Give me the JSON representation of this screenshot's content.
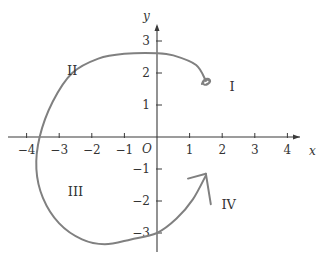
{
  "chart_data": {
    "type": "line",
    "title": "",
    "xlabel": "x",
    "ylabel": "y",
    "origin_label": "O",
    "xlim": [
      -4.5,
      4.6
    ],
    "ylim": [
      -3.6,
      3.6
    ],
    "grid": false,
    "x_ticks": [
      -4,
      -3,
      -2,
      -1,
      1,
      2,
      3,
      4
    ],
    "x_tick_labels": [
      "−4",
      "−3",
      "−2",
      "−1",
      "1",
      "2",
      "3",
      "4"
    ],
    "y_ticks": [
      3,
      2,
      1,
      -1,
      -2,
      -3
    ],
    "y_tick_labels": [
      "3",
      "2",
      "1",
      "−1",
      "−2",
      "−3"
    ],
    "quadrant_labels": [
      {
        "text": "I",
        "x": 2.3,
        "y": 1.6
      },
      {
        "text": "II",
        "x": -2.6,
        "y": 2.1
      },
      {
        "text": "III",
        "x": -2.5,
        "y": -1.7
      },
      {
        "text": "IV",
        "x": 2.2,
        "y": -2.1
      }
    ],
    "series": [
      {
        "name": "path",
        "color": "#808080",
        "points": [
          [
            1.5,
            1.75
          ],
          [
            1.2,
            2.25
          ],
          [
            0.5,
            2.55
          ],
          [
            0.0,
            2.62
          ],
          [
            -1.0,
            2.6
          ],
          [
            -1.8,
            2.45
          ],
          [
            -2.6,
            2.0
          ],
          [
            -3.2,
            1.1
          ],
          [
            -3.6,
            0.0
          ],
          [
            -3.7,
            -1.0
          ],
          [
            -3.5,
            -1.9
          ],
          [
            -3.0,
            -2.7
          ],
          [
            -2.3,
            -3.2
          ],
          [
            -1.6,
            -3.35
          ],
          [
            -0.8,
            -3.2
          ],
          [
            0.0,
            -3.0
          ],
          [
            0.6,
            -2.55
          ],
          [
            1.1,
            -1.95
          ],
          [
            1.5,
            -1.2
          ]
        ],
        "start_marker": "scribble",
        "end_marker": "arrow"
      }
    ],
    "arrow_tip": [
      1.5,
      -1.15
    ],
    "arrow_barbs": [
      [
        0.95,
        -1.3
      ],
      [
        1.65,
        -2.1
      ]
    ]
  }
}
